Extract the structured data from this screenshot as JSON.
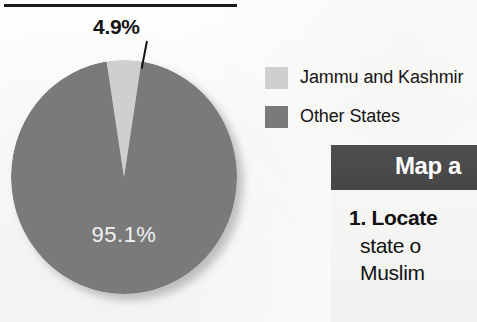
{
  "figure": {
    "has_top_rule": true,
    "background_color": "#fdfdfb"
  },
  "chart_data": {
    "type": "pie",
    "title": "",
    "categories": [
      "Jammu and Kashmir",
      "Other States"
    ],
    "values": [
      4.9,
      95.1
    ],
    "value_labels": [
      "4.9%",
      "95.1%"
    ],
    "colors": [
      "#cfcfcf",
      "#7a7a7a"
    ],
    "units": "percent",
    "start_angle_deg": 0,
    "direction": "clockwise",
    "legend_position": "right",
    "grid": false,
    "annotations": [
      {
        "text": "4.9%",
        "target": "Jammu and Kashmir",
        "style": "leader-line-callout"
      },
      {
        "text": "95.1%",
        "target": "Other States",
        "style": "inside-slice"
      }
    ]
  },
  "slice_callout": {
    "label": "4.9%"
  },
  "slice_inner": {
    "label": "95.1%"
  },
  "legend": {
    "items": [
      {
        "label": "Jammu and Kashmir",
        "color": "#cfcfcf"
      },
      {
        "label": "Other States",
        "color": "#7a7a7a"
      }
    ]
  },
  "map_card": {
    "header_title": "Map a",
    "header_color": "#4a4a4a",
    "lines": [
      "1. Locate",
      "state o",
      "Muslim"
    ]
  }
}
